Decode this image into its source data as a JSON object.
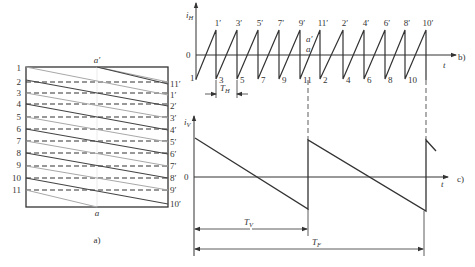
{
  "panel_a": {
    "caption": "a)",
    "top_label": "a′",
    "bottom_label": "a",
    "left_labels": [
      "1",
      "2",
      "3",
      "4",
      "5",
      "6",
      "7",
      "8",
      "9",
      "10",
      "11"
    ],
    "right_labels": [
      "11′",
      "1′",
      "2′",
      "3′",
      "4′",
      "5′",
      "6′",
      "7′",
      "8′",
      "9′",
      "10′"
    ]
  },
  "panel_b": {
    "caption": "b)",
    "y_axis_label": "i",
    "y_axis_sub": "H",
    "x_axis_label": "t",
    "zero_label": "0",
    "peak_labels": [
      "1′",
      "3′",
      "5′",
      "7′",
      "9′",
      "11′",
      "2′",
      "4′",
      "6′",
      "8′",
      "10′"
    ],
    "bottom_labels": [
      "1",
      "3",
      "5",
      "7",
      "9",
      "11",
      "2",
      "4",
      "6",
      "8",
      "10"
    ],
    "a_prime_label": "a′",
    "a_label": "a",
    "period_label": "T",
    "period_sub": "H"
  },
  "panel_c": {
    "caption": "c)",
    "y_axis_label": "i",
    "y_axis_sub": "V",
    "x_axis_label": "t",
    "zero_label": "0",
    "tv_label": "T",
    "tv_sub": "V",
    "tf_label": "T",
    "tf_sub": "F"
  },
  "colors": {
    "ink": "#333333",
    "light_line": "#a8a8a8",
    "dark_line": "#444444"
  }
}
